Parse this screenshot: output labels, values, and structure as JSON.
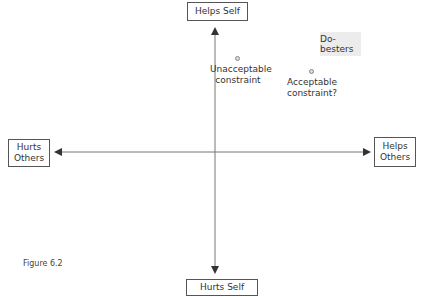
{
  "figure": {
    "caption": "Figure 6.2",
    "axes": {
      "top": "Helps Self",
      "bottom": "Hurts Self",
      "left_line1": "Hurts",
      "left_line2": "Others",
      "right_line1": "Helps",
      "right_line2": "Others"
    },
    "points": [
      {
        "label_line1": "Unacceptable",
        "label_line2": "constraint"
      },
      {
        "label_line1": "Acceptable",
        "label_line2": "constraint?"
      }
    ],
    "region_label": "Do-besters",
    "colors": {
      "axis": "#555555",
      "shaded": "#ececec"
    }
  }
}
